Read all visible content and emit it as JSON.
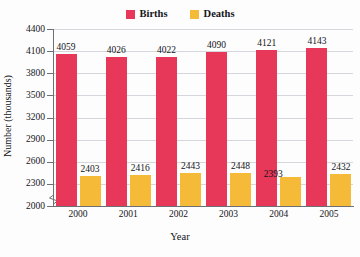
{
  "figure": {
    "title_fragment": "Births and Deaths",
    "background_color": "#fdfdfe"
  },
  "legend": {
    "position": "top-center",
    "items": [
      {
        "label": "Births",
        "color": "#e8385a",
        "swatch_icon": "square-swatch-icon"
      },
      {
        "label": "Deaths",
        "color": "#f5bb38",
        "swatch_icon": "square-swatch-icon"
      }
    ]
  },
  "axes": {
    "x_title": "Year",
    "y_title": "Number (thousands)",
    "y_ticks": [
      "2000",
      "2300",
      "2600",
      "2900",
      "3200",
      "3500",
      "3800",
      "4100",
      "4400"
    ],
    "x_ticks": [
      "2000",
      "2001",
      "2002",
      "2003",
      "2004",
      "2005"
    ],
    "y_axis_break": true
  },
  "chart_data": {
    "type": "bar",
    "title": "Births and Deaths",
    "xlabel": "Year",
    "ylabel": "Number (thousands)",
    "categories": [
      "2000",
      "2001",
      "2002",
      "2003",
      "2004",
      "2005"
    ],
    "series": [
      {
        "name": "Births",
        "color": "#e8385a",
        "values": [
          4059,
          4026,
          4022,
          4090,
          4121,
          4143
        ]
      },
      {
        "name": "Deaths",
        "color": "#f5bb38",
        "values": [
          2403,
          2416,
          2443,
          2448,
          2393,
          2432
        ]
      }
    ],
    "ylim": [
      2000,
      4400
    ],
    "y_tick_step": 300,
    "grid": true,
    "grid_axis": "y",
    "legend_position": "top-center",
    "value_labels": true,
    "axis_break_below": 2000
  },
  "bar_labels": {
    "births": [
      "4059",
      "4026",
      "4022",
      "4090",
      "4121",
      "4143"
    ],
    "deaths": [
      "2403",
      "2416",
      "2443",
      "2448",
      "2393",
      "2432"
    ]
  }
}
